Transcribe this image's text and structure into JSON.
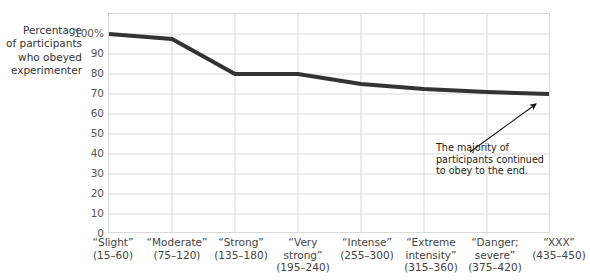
{
  "chart_data": {
    "type": "line",
    "title": "",
    "subtitle": "",
    "ylabel": "Percentage\nof participants\nwho obeyed\nexperimenter",
    "xlabel": "",
    "ylim": [
      0,
      100
    ],
    "ytick_labels": [
      "100%",
      "90",
      "80",
      "70",
      "60",
      "50",
      "40",
      "30",
      "20",
      "10",
      "0"
    ],
    "ytick_values": [
      100,
      90,
      80,
      70,
      60,
      50,
      40,
      30,
      20,
      10,
      0
    ],
    "grid": true,
    "legend": "none",
    "categories": [
      "“Slight”\n(15–60)",
      "“Moderate”\n(75–120)",
      "“Strong”\n(135–180)",
      "“Very\nstrong”\n(195–240)",
      "“Intense”\n(255–300)",
      "“Extreme\nintensity”\n(315–360)",
      "“Danger;\nsevere”\n(375–420)",
      "“XXX”\n(435–450)"
    ],
    "category_names": [
      "Slight",
      "Moderate",
      "Strong",
      "Very strong",
      "Intense",
      "Extreme intensity",
      "Danger; severe",
      "XXX"
    ],
    "category_ranges": [
      "(15–60)",
      "(75–120)",
      "(135–180)",
      "(195–240)",
      "(255–300)",
      "(315–360)",
      "(375–420)",
      "(435–450)"
    ],
    "values": [
      100,
      97.5,
      80,
      80,
      75,
      72.5,
      71,
      70
    ],
    "series": [
      {
        "name": "Percentage of participants who obeyed experimenter",
        "values": [
          100,
          97.5,
          80,
          80,
          75,
          72.5,
          71,
          70
        ],
        "color": "#333333"
      }
    ],
    "annotations": [
      {
        "name": "majority-note",
        "text": "The majority of\nparticipants continued\nto obey to the end.",
        "points_to_category": "“XXX” (435–450)",
        "points_to_value": 70
      }
    ]
  },
  "line_color": "#333333",
  "grid_color": "#d9d9d9",
  "annotation": {
    "text": "The majority of\nparticipants continued\nto obey to the end."
  }
}
